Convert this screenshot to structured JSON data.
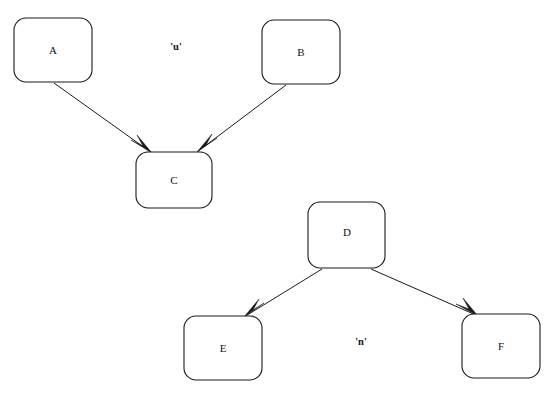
{
  "diagram": {
    "type": "tree-graph",
    "background_color": "#ffffff",
    "stroke_color": "#1a1a1a",
    "text_color": "#111111",
    "width": 554,
    "height": 397,
    "nodes": [
      {
        "id": "A",
        "label": "A",
        "x": 14,
        "y": 18,
        "w": 78,
        "h": 64,
        "rx": 12
      },
      {
        "id": "B",
        "label": "B",
        "x": 262,
        "y": 20,
        "w": 78,
        "h": 64,
        "rx": 12
      },
      {
        "id": "C",
        "label": "C",
        "x": 136,
        "y": 152,
        "w": 76,
        "h": 56,
        "rx": 12
      },
      {
        "id": "D",
        "label": "D",
        "x": 308,
        "y": 202,
        "w": 77,
        "h": 66,
        "rx": 12
      },
      {
        "id": "E",
        "label": "E",
        "x": 184,
        "y": 316,
        "w": 78,
        "h": 64,
        "rx": 12
      },
      {
        "id": "F",
        "label": "F",
        "x": 462,
        "y": 314,
        "w": 78,
        "h": 64,
        "rx": 12
      }
    ],
    "edges": [
      {
        "id": "A-C",
        "from": "A",
        "to": "C",
        "x1": 54,
        "y1": 83,
        "x2": 152,
        "y2": 153
      },
      {
        "id": "B-C",
        "from": "B",
        "to": "C",
        "x1": 286,
        "y1": 85,
        "x2": 197,
        "y2": 152
      },
      {
        "id": "D-E",
        "from": "D",
        "to": "E",
        "x1": 322,
        "y1": 269,
        "x2": 244,
        "y2": 317
      },
      {
        "id": "D-F",
        "from": "D",
        "to": "F",
        "x1": 371,
        "y1": 269,
        "x2": 478,
        "y2": 316
      }
    ],
    "cluster_labels": [
      {
        "id": "u",
        "text": "'u'",
        "x": 176,
        "y": 48
      },
      {
        "id": "n",
        "text": "'n'",
        "x": 361,
        "y": 343
      }
    ]
  }
}
